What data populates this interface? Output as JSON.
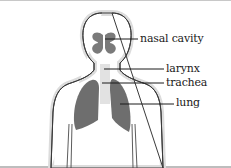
{
  "diagram": {
    "labels": [
      {
        "id": "nasal-cavity",
        "text": "nasal cavity"
      },
      {
        "id": "larynx",
        "text": "larynx"
      },
      {
        "id": "trachea",
        "text": "trachea"
      },
      {
        "id": "lung",
        "text": "lung"
      }
    ],
    "colors": {
      "outline": "#3a3a3a",
      "halo": "#d9d9d9",
      "organ": "#6e6e6e",
      "airway": "#e4e4e4",
      "leader_line": "#1a1a1a"
    }
  }
}
